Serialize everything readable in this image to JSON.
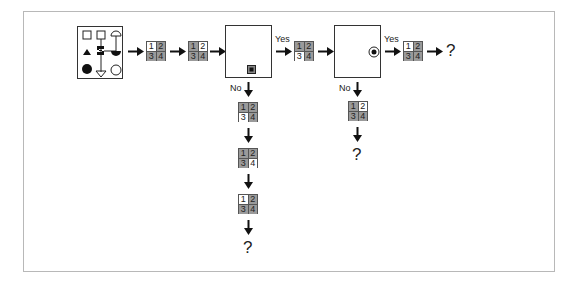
{
  "diagram": {
    "labels": {
      "yes": "Yes",
      "no": "No",
      "unknown": "?"
    },
    "symbol_panel": {
      "symbols": [
        "square-outline",
        "square-outline",
        "semicircle-top-outline",
        "triangle-filled",
        "z-connector-filled",
        "semicircle-bottom-filled",
        "circle-filled",
        "triangle-down-outline",
        "circle-outline"
      ]
    },
    "grids": {
      "A": {
        "cells": [
          "1",
          "2",
          "3",
          "4"
        ],
        "white_cell": 1
      },
      "B": {
        "cells": [
          "1",
          "2",
          "3",
          "4"
        ],
        "white_cell": 2
      },
      "C": {
        "cells": [
          "1",
          "2",
          "3",
          "4"
        ],
        "white_cell": 3
      },
      "D": {
        "cells": [
          "1",
          "2",
          "3",
          "4"
        ],
        "white_cell": 1
      },
      "E": {
        "cells": [
          "1",
          "2",
          "3",
          "4"
        ],
        "white_cell": 3
      },
      "F": {
        "cells": [
          "1",
          "2",
          "3",
          "4"
        ],
        "white_cell": 4
      },
      "G": {
        "cells": [
          "1",
          "2",
          "3",
          "4"
        ],
        "white_cell": 1
      },
      "H": {
        "cells": [
          "1",
          "2",
          "3",
          "4"
        ],
        "white_cell": 2
      }
    },
    "decision_boxes": [
      {
        "id": "box1",
        "marker": "filled-square-bottom-right"
      },
      {
        "id": "box2",
        "marker": "bullseye-right"
      }
    ],
    "colors": {
      "cell_shaded": "#9a9a9a",
      "cell_white": "#ffffff",
      "line": "#222222",
      "frame": "#b8b8b8"
    }
  }
}
